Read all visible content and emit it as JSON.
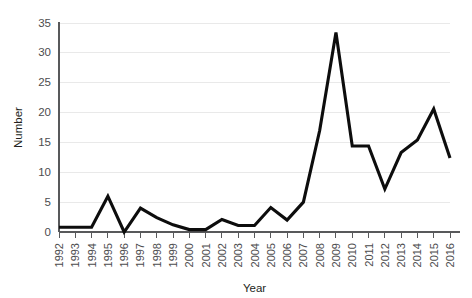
{
  "chart_data": {
    "type": "line",
    "title": "",
    "xlabel": "Year",
    "ylabel": "Number",
    "categories": [
      "1992",
      "1993",
      "1994",
      "1995",
      "1996",
      "1997",
      "1998",
      "1999",
      "2000",
      "2001",
      "2002",
      "2003",
      "2004",
      "2005",
      "2006",
      "2007",
      "2008",
      "2009",
      "2010",
      "2011",
      "2012",
      "2013",
      "2014",
      "2015",
      "2016"
    ],
    "x": [
      1992,
      1993,
      1994,
      1995,
      1996,
      1997,
      1998,
      1999,
      2000,
      2001,
      2002,
      2003,
      2004,
      2005,
      2006,
      2007,
      2008,
      2009,
      2010,
      2011,
      2012,
      2013,
      2014,
      2015,
      2016
    ],
    "values": [
      0.8,
      0.8,
      0.8,
      6.0,
      0.0,
      4.0,
      2.4,
      1.2,
      0.4,
      0.4,
      2.1,
      1.1,
      1.1,
      4.1,
      2.0,
      5.0,
      17.0,
      33.4,
      14.4,
      14.4,
      7.2,
      13.3,
      15.4,
      20.6,
      12.4
    ],
    "series": [
      {
        "name": "Number",
        "values": [
          0.8,
          0.8,
          0.8,
          6.0,
          0.0,
          4.0,
          2.4,
          1.2,
          0.4,
          0.4,
          2.1,
          1.1,
          1.1,
          4.1,
          2.0,
          5.0,
          17.0,
          33.4,
          14.4,
          14.4,
          7.2,
          13.3,
          15.4,
          20.6,
          12.4
        ],
        "color": "#0d0d0d"
      }
    ],
    "ylim": [
      0,
      35
    ],
    "yticks": [
      0,
      5,
      10,
      15,
      20,
      25,
      30,
      35
    ],
    "ytick_labels": [
      "0",
      "5",
      "10",
      "15",
      "20",
      "25",
      "30",
      "35"
    ],
    "xlim": [
      1992,
      2016
    ],
    "grid": true,
    "grid_axis": "y",
    "legend": false,
    "legend_position": "none",
    "line_color": "#0d0d0d",
    "gridline_color": "#e9e9e9",
    "axis_color": "#58595b",
    "background_color": "#ffffff",
    "xtick_label_rotation": 90
  }
}
